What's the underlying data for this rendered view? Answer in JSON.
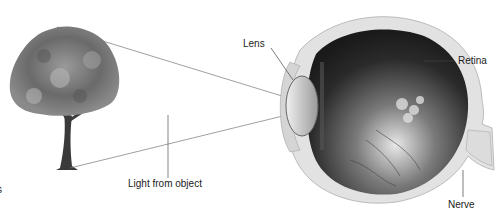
{
  "diagram": {
    "labels": {
      "lens": "Lens",
      "retina": "Retina",
      "nerve": "Nerve",
      "light": "Light from object",
      "cutoff": "s"
    },
    "elements": [
      "tree",
      "light-rays",
      "eye-cross-section"
    ]
  }
}
